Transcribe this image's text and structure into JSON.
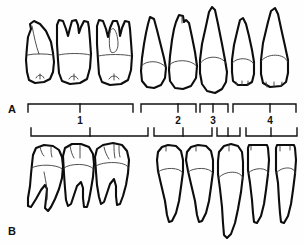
{
  "figure": {
    "background_color": "#fefefe",
    "outline_color": "#0d0d0d",
    "detail_color": "#3b3b3b",
    "width": 304,
    "height": 244
  },
  "rows": [
    {
      "label": "A",
      "name": "maxillary-row",
      "description": "Maxillary (upper) permanent teeth, facial view",
      "teeth": [
        {
          "name": "maxillary-first-molar",
          "roots": 3,
          "group": 1
        },
        {
          "name": "maxillary-second-molar",
          "roots": 3,
          "group": 1
        },
        {
          "name": "maxillary-third-molar",
          "roots": 3,
          "group": 1
        },
        {
          "name": "maxillary-first-premolar",
          "roots": 2,
          "group": 2
        },
        {
          "name": "maxillary-second-premolar",
          "roots": 1,
          "group": 2
        },
        {
          "name": "maxillary-canine",
          "roots": 1,
          "group": 3
        },
        {
          "name": "maxillary-lateral-incisor",
          "roots": 1,
          "group": 4
        },
        {
          "name": "maxillary-central-incisor",
          "roots": 1,
          "group": 4
        }
      ]
    },
    {
      "label": "B",
      "name": "mandibular-row",
      "description": "Mandibular (lower) permanent teeth, facial view",
      "teeth": [
        {
          "name": "mandibular-first-molar",
          "roots": 2,
          "group": 1
        },
        {
          "name": "mandibular-second-molar",
          "roots": 2,
          "group": 1
        },
        {
          "name": "mandibular-third-molar",
          "roots": 2,
          "group": 1
        },
        {
          "name": "mandibular-first-premolar",
          "roots": 1,
          "group": 2
        },
        {
          "name": "mandibular-second-premolar",
          "roots": 1,
          "group": 2
        },
        {
          "name": "mandibular-canine",
          "roots": 1,
          "group": 3
        },
        {
          "name": "mandibular-lateral-incisor",
          "roots": 1,
          "group": 4
        },
        {
          "name": "mandibular-central-incisor",
          "roots": 1,
          "group": 4
        }
      ]
    }
  ],
  "groups": [
    {
      "number": "1",
      "name": "molars-group"
    },
    {
      "number": "2",
      "name": "premolars-group"
    },
    {
      "number": "3",
      "name": "canine-group"
    },
    {
      "number": "4",
      "name": "incisors-group"
    }
  ]
}
